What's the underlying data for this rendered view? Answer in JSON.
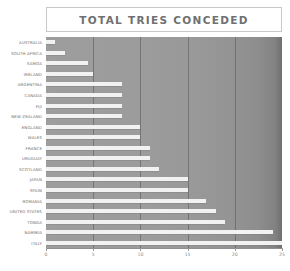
{
  "chart_data": {
    "type": "bar",
    "orientation": "horizontal",
    "title": "TOTAL TRIES CONCEDED",
    "xlabel": "",
    "ylabel": "",
    "xlim": [
      0,
      25
    ],
    "xticks": [
      0,
      5,
      10,
      15,
      20,
      25
    ],
    "xtick_labels": [
      "0",
      "5",
      "10",
      "15",
      "20",
      "25"
    ],
    "grid": "vertical",
    "legend": "none",
    "bar_color": "#f2f2f2",
    "plot_background": "#9a9a9a",
    "title_color": "#6f7072",
    "label_color": "#6d6d6d",
    "categories": [
      "AUSTRALIA",
      "SOUTH AFRICA",
      "SAMOA",
      "IRELAND",
      "ARGENTINA",
      "CANADA",
      "FIJI",
      "NEW ZEALAND",
      "ENGLAND",
      "WALES",
      "FRANCE",
      "URUGUAY",
      "SCOTLAND",
      "JAPAN",
      "SPAIN",
      "ROMANIA",
      "UNITED STATES",
      "TONGA",
      "NAMIBIA",
      "ITALY"
    ],
    "values": [
      1,
      2,
      4.5,
      5,
      8,
      8,
      8,
      8,
      10,
      10,
      11,
      11,
      12,
      15,
      15,
      17,
      18,
      19,
      24,
      25
    ]
  }
}
